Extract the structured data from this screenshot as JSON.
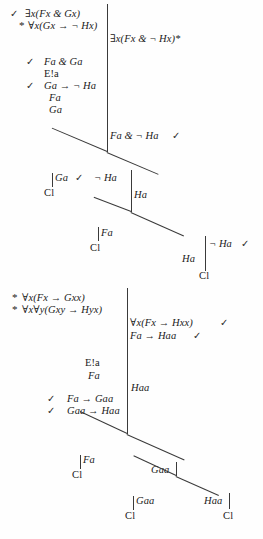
{
  "document": {
    "kind": "logic-truth-tree-proofs",
    "proof_count": 2
  },
  "symbols": {
    "check": "✓",
    "star": "*",
    "closed": "Cl"
  },
  "proof1": {
    "premises": [
      {
        "mark": "✓",
        "text": "∃x(Fx & Gx)"
      },
      {
        "mark": "*",
        "text": "∀x(Gx → ¬ Hx)"
      }
    ],
    "conclusion": {
      "text": "∃x(Fx & ¬ Hx)*"
    },
    "derivation": [
      {
        "mark": "✓",
        "text": "Fa & Ga"
      },
      {
        "mark": "",
        "text": "E!a"
      },
      {
        "mark": "✓",
        "text": "Ga → ¬ Ha"
      },
      {
        "mark": "",
        "text": "Fa"
      },
      {
        "mark": "",
        "text": "Ga"
      }
    ],
    "trunk": {
      "text": "Fa & ¬ Ha",
      "mark": "✓"
    },
    "branch1": {
      "left": {
        "text": "Ga",
        "close": "Cl"
      },
      "right": {
        "text": "¬ Ha",
        "mark": "✓",
        "below": "Ha"
      }
    },
    "branch2": {
      "left": {
        "text": "Fa",
        "close": "Cl"
      },
      "right": {
        "text": "¬ Ha",
        "mark": "✓",
        "below": "Ha",
        "close": "Cl"
      }
    }
  },
  "proof2": {
    "premises": [
      {
        "mark": "*",
        "text": "∀x(Fx → Gxx)"
      },
      {
        "mark": "*",
        "text": "∀x∀y(Gxy → Hyx)"
      }
    ],
    "conclusion": [
      {
        "text": "∀x(Fx → Hxx)",
        "mark": "✓"
      },
      {
        "text": "Fa → Haa",
        "mark": "✓"
      }
    ],
    "derivation": [
      {
        "mark": "",
        "text": "E!a"
      },
      {
        "mark": "",
        "text": "Fa"
      },
      {
        "mark": "✓",
        "text": "Fa → Gaa"
      },
      {
        "mark": "✓",
        "text": "Gaa → Haa"
      }
    ],
    "trunk": {
      "text": "Haa"
    },
    "branch1": {
      "left": {
        "text": "Fa",
        "close": "Cl"
      },
      "right": {
        "text": "Gaa"
      }
    },
    "branch2": {
      "left": {
        "text": "Gaa",
        "close": "Cl"
      },
      "right": {
        "text": "Haa",
        "close": "Cl"
      }
    }
  }
}
